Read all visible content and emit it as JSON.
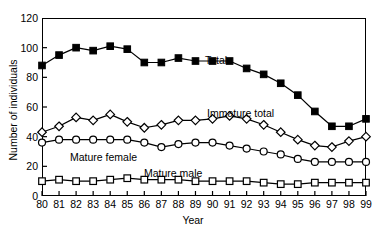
{
  "chart_data": {
    "type": "line",
    "title": "",
    "xlabel": "Year",
    "ylabel": "Number of individuals",
    "x": [
      80,
      81,
      82,
      83,
      84,
      85,
      86,
      87,
      88,
      89,
      90,
      91,
      92,
      93,
      94,
      95,
      96,
      97,
      98,
      99
    ],
    "xtick_labels": [
      "80",
      "81",
      "82",
      "83",
      "84",
      "85",
      "86",
      "87",
      "88",
      "89",
      "90",
      "91",
      "92",
      "93",
      "94",
      "95",
      "96",
      "97",
      "98",
      "99"
    ],
    "xlim": [
      80,
      99
    ],
    "ylim": [
      0,
      120
    ],
    "ytick_labels": [
      "0",
      "20",
      "40",
      "60",
      "80",
      "100",
      "120"
    ],
    "yticks": [
      0,
      20,
      40,
      60,
      80,
      100,
      120
    ],
    "grid": false,
    "legend_position": "inline-annotations",
    "series": [
      {
        "name": "Total",
        "marker": "filled-square",
        "color": "#000000",
        "values": [
          88,
          95,
          100,
          98,
          101,
          99,
          90,
          90,
          93,
          91,
          91,
          91,
          86,
          82,
          76,
          68,
          57,
          47,
          47,
          52
        ]
      },
      {
        "name": "Immature total",
        "marker": "open-diamond",
        "color": "#000000",
        "values": [
          43,
          47,
          53,
          51,
          55,
          50,
          46,
          48,
          51,
          51,
          52,
          54,
          52,
          48,
          43,
          38,
          34,
          33,
          37,
          40
        ]
      },
      {
        "name": "Mature female",
        "marker": "open-circle",
        "color": "#000000",
        "values": [
          36,
          38,
          38,
          38,
          38,
          38,
          36,
          33,
          35,
          36,
          36,
          34,
          32,
          30,
          28,
          25,
          23,
          23,
          23,
          23
        ]
      },
      {
        "name": "Mature male",
        "marker": "open-square",
        "color": "#000000",
        "values": [
          10,
          11,
          10,
          10,
          11,
          12,
          11,
          11,
          11,
          10,
          10,
          10,
          10,
          9,
          8,
          8,
          9,
          9,
          9,
          9
        ]
      }
    ],
    "annotations": [
      {
        "text": "Total",
        "series": "Total"
      },
      {
        "text": "Immature total",
        "series": "Immature total"
      },
      {
        "text": "Mature female",
        "series": "Mature female"
      },
      {
        "text": "Mature male",
        "series": "Mature male"
      }
    ]
  }
}
